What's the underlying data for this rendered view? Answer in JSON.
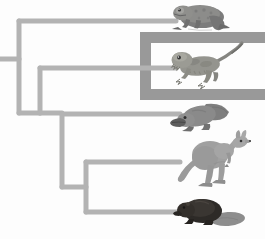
{
  "figure": {
    "title": "Cladogram of tetrapod vertebrates",
    "type": "phylogenetic-tree",
    "width": 265,
    "height": 239,
    "background_color": "#fdfdfd"
  },
  "colors": {
    "branch": "#b3b3b3",
    "branch_shadow": "#c9c9c9",
    "highlight_box": "#999999",
    "animal_body": "#8a8a8a",
    "animal_dark": "#3a3a3a",
    "frog_body": "#7e7e7e",
    "lizard_body": "#9a9a96",
    "platypus_body": "#8d8d8d",
    "kangaroo_body": "#9b9b9b",
    "beaver_body": "#2e2b28",
    "beaver_tail": "#8f8f8f"
  },
  "tree": {
    "root": {
      "name": "root-stem",
      "x1": 0,
      "y1": 59,
      "x2": 19,
      "y2": 59
    },
    "nodes": [
      {
        "name": "node-tetrapoda",
        "x": 19,
        "y_top": 21,
        "y_bottom": 113
      },
      {
        "name": "node-amniota",
        "x": 40,
        "y_top": 68,
        "y_bottom": 113
      },
      {
        "name": "node-mammalia",
        "x": 62,
        "y_top": 114,
        "y_bottom": 187
      },
      {
        "name": "node-theria",
        "x": 86,
        "y_top": 162,
        "y_bottom": 212
      }
    ],
    "branch_width": 5,
    "tips": [
      {
        "name": "tip-frog",
        "label": "frog",
        "from_x": 19,
        "y": 21,
        "to_x": 176
      },
      {
        "name": "tip-lizard",
        "label": "lizard",
        "from_x": 40,
        "y": 68,
        "to_x": 176
      },
      {
        "name": "tip-platypus",
        "label": "platypus",
        "from_x": 62,
        "y": 114,
        "to_x": 180
      },
      {
        "name": "tip-kangaroo",
        "label": "kangaroo",
        "from_x": 86,
        "y": 162,
        "to_x": 180
      },
      {
        "name": "tip-beaver",
        "label": "beaver",
        "from_x": 86,
        "y": 212,
        "to_x": 180
      }
    ],
    "connectors": [
      {
        "name": "connector-node-amniota",
        "x1": 19,
        "y1": 113,
        "x2": 40,
        "y2": 113
      },
      {
        "name": "connector-node-mammalia",
        "x1": 40,
        "y1": 113,
        "x2": 62,
        "y2": 113
      },
      {
        "name": "connector-node-theria",
        "x1": 62,
        "y1": 187,
        "x2": 86,
        "y2": 187
      }
    ]
  },
  "highlight": {
    "name": "highlight-bracket",
    "description": "dark grey bracket enclosing the lizard clade",
    "x": 140,
    "y": 32,
    "width": 125,
    "height": 68,
    "stroke": 11,
    "open_side": "right"
  },
  "animals": [
    {
      "name": "animal-frog",
      "label": "frog",
      "x": 173,
      "y": 1,
      "w": 60,
      "h": 31
    },
    {
      "name": "animal-lizard",
      "label": "lizard",
      "x": 172,
      "y": 47,
      "w": 68,
      "h": 43
    },
    {
      "name": "animal-platypus",
      "label": "platypus",
      "x": 176,
      "y": 100,
      "w": 57,
      "h": 32
    },
    {
      "name": "animal-kangaroo",
      "label": "kangaroo",
      "x": 178,
      "y": 135,
      "w": 72,
      "h": 52
    },
    {
      "name": "animal-beaver",
      "label": "beaver",
      "x": 178,
      "y": 198,
      "w": 68,
      "h": 33
    }
  ]
}
